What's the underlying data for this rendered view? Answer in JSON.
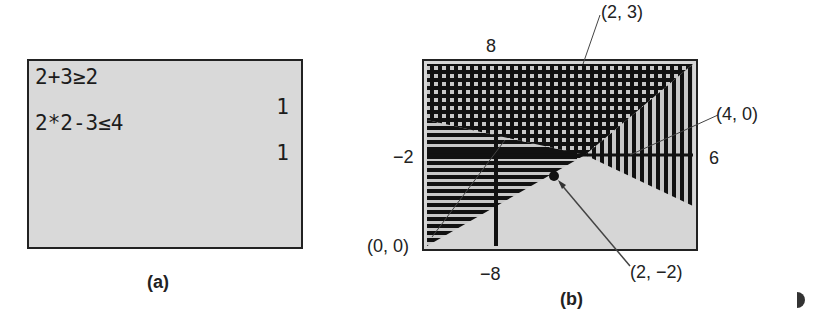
{
  "panel_a": {
    "caption": "(a)",
    "lines": [
      {
        "expression": "2+3≥2",
        "result": "1"
      },
      {
        "expression": "2*2-3≤4",
        "result": "1"
      }
    ]
  },
  "panel_b": {
    "caption": "(b)",
    "window": {
      "xmin": "-8",
      "xmax": "6",
      "ymin": "-8",
      "ymax": "8",
      "label_left": "-2"
    },
    "tick_labels": {
      "top": "8",
      "bottom": "−8",
      "left": "−2",
      "right": "6"
    },
    "annotations": [
      {
        "text": "(2, 3)"
      },
      {
        "text": "(4, 0)"
      },
      {
        "text": "(0, 0)"
      },
      {
        "text": "(2, −2)"
      }
    ],
    "colors": {
      "screen_bg": "#d9d9d9",
      "ink": "#111111"
    }
  }
}
